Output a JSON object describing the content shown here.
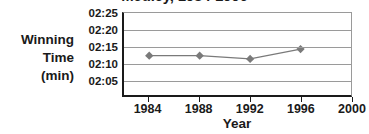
{
  "chart_data": {
    "type": "line",
    "title": "Medley, 1984-1996",
    "xlabel": "Year",
    "ylabel": "Winning Time (min)",
    "ylabel_lines": [
      "Winning",
      "Time",
      "(min)"
    ],
    "x": [
      1984,
      1988,
      1992,
      1996
    ],
    "values": [
      "02:12",
      "02:12",
      "02:11",
      "02:14"
    ],
    "values_seconds": [
      132,
      132,
      131,
      134
    ],
    "xlim": [
      1982,
      2000
    ],
    "ylim": [
      "02:05",
      "02:25"
    ],
    "ylim_seconds": [
      125,
      145
    ],
    "x_tick_labels": [
      "1984",
      "1988",
      "1992",
      "1996",
      "2000"
    ],
    "y_tick_labels": [
      "02:25",
      "02:20",
      "02:15",
      "02:10",
      "02:05"
    ],
    "y_tick_seconds": [
      145,
      140,
      135,
      130,
      125
    ],
    "grid": true,
    "legend": "none",
    "marker": "diamond",
    "series_color": "#7a7a7a",
    "grid_color": "#9a9a9a",
    "axis_color": "#1a1a1a",
    "text_color": "#1a1a1a"
  }
}
